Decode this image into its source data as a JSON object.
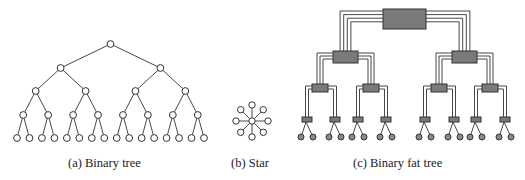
{
  "figures": [
    {
      "id": "a",
      "caption": "(a) Binary tree",
      "type": "binary-tree",
      "levels": 5,
      "leaves": 16
    },
    {
      "id": "b",
      "caption": "(b) Star",
      "type": "star",
      "outer_nodes": 8
    },
    {
      "id": "c",
      "caption": "(c) Binary fat tree",
      "type": "fat-tree",
      "levels": 4,
      "leaves": 16
    }
  ],
  "colors": {
    "line": "#333333",
    "node_fill": "#ffffff",
    "switch_fill": "#7a7a7a",
    "leaf_fill": "#8a8a8a"
  }
}
